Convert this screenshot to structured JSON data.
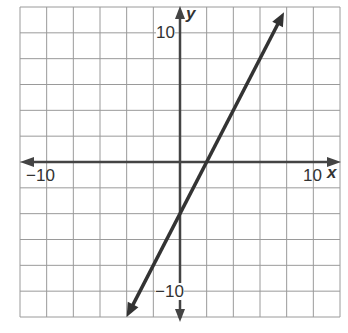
{
  "chart_data": {
    "type": "line",
    "title": "",
    "xlabel": "x",
    "ylabel": "y",
    "xlim": [
      -12,
      12
    ],
    "ylim": [
      -12,
      12
    ],
    "grid": true,
    "grid_step": 2,
    "tick_labels": {
      "x_min": "−10",
      "x_max": "10",
      "y_max": "10",
      "y_min": "−10"
    },
    "series": [
      {
        "name": "line",
        "equation": "y = 2x - 4",
        "slope": 2,
        "intercept": -4,
        "x": [
          -4,
          0,
          2,
          7.8
        ],
        "y": [
          -12,
          -4,
          0,
          11.6
        ],
        "arrows": "both",
        "color": "#333333"
      }
    ]
  }
}
